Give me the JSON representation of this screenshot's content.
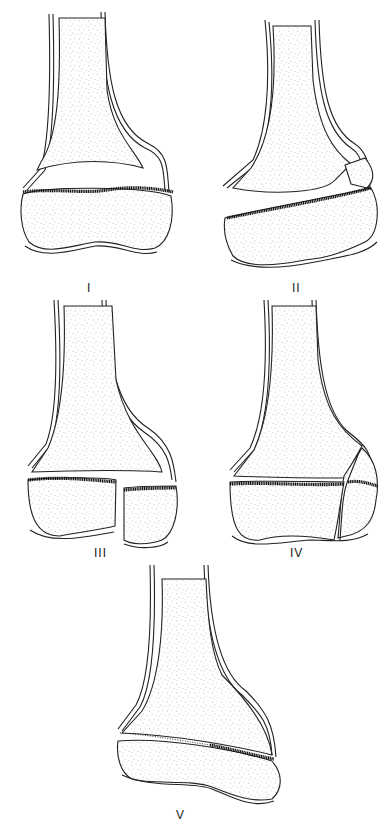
{
  "figure": {
    "top_caption_fragment": "",
    "panels": [
      {
        "id": "I",
        "label": "I"
      },
      {
        "id": "II",
        "label": "II"
      },
      {
        "id": "III",
        "label": "III"
      },
      {
        "id": "IV",
        "label": "IV"
      },
      {
        "id": "V",
        "label": "V"
      }
    ]
  },
  "colors": {
    "line": "#222222",
    "physis": "#111111",
    "background": "#ffffff"
  }
}
